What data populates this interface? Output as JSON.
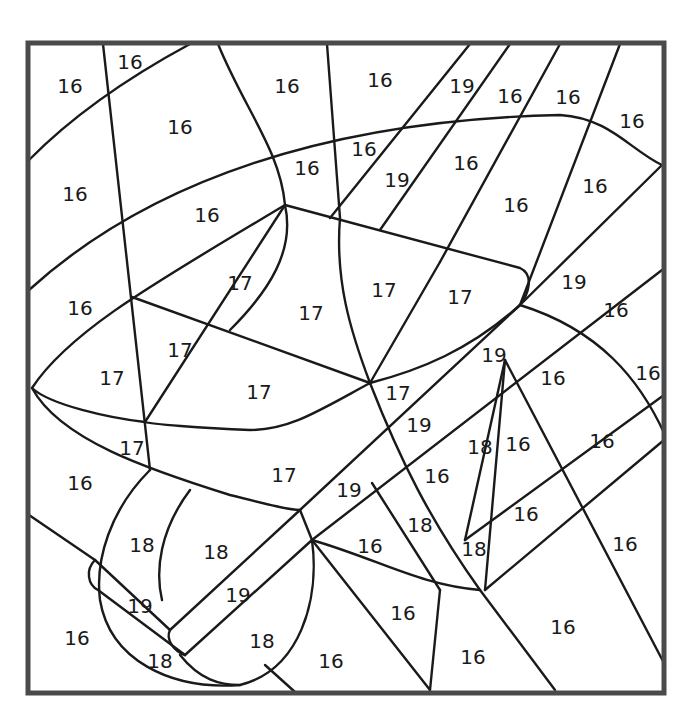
{
  "puzzle": {
    "type": "color-by-number",
    "subject": "wheelbarrow",
    "colors": {
      "line": "#1a1a1a",
      "frame": "#4a4a4a",
      "background": "#ffffff"
    },
    "frame": {
      "x": 28,
      "y": 43,
      "width": 636,
      "height": 650
    },
    "regions": [
      {
        "n": "16",
        "x": 70,
        "y": 86
      },
      {
        "n": "16",
        "x": 130,
        "y": 62
      },
      {
        "n": "16",
        "x": 180,
        "y": 127
      },
      {
        "n": "16",
        "x": 287,
        "y": 86
      },
      {
        "n": "16",
        "x": 380,
        "y": 80
      },
      {
        "n": "19",
        "x": 462,
        "y": 86
      },
      {
        "n": "16",
        "x": 510,
        "y": 96
      },
      {
        "n": "16",
        "x": 568,
        "y": 97
      },
      {
        "n": "16",
        "x": 632,
        "y": 121
      },
      {
        "n": "16",
        "x": 75,
        "y": 194
      },
      {
        "n": "16",
        "x": 207,
        "y": 215
      },
      {
        "n": "16",
        "x": 307,
        "y": 168
      },
      {
        "n": "16",
        "x": 364,
        "y": 149
      },
      {
        "n": "19",
        "x": 397,
        "y": 180
      },
      {
        "n": "16",
        "x": 466,
        "y": 163
      },
      {
        "n": "16",
        "x": 516,
        "y": 205
      },
      {
        "n": "16",
        "x": 595,
        "y": 186
      },
      {
        "n": "16",
        "x": 80,
        "y": 308
      },
      {
        "n": "17",
        "x": 240,
        "y": 283
      },
      {
        "n": "17",
        "x": 311,
        "y": 313
      },
      {
        "n": "17",
        "x": 384,
        "y": 290
      },
      {
        "n": "17",
        "x": 460,
        "y": 297
      },
      {
        "n": "19",
        "x": 574,
        "y": 282
      },
      {
        "n": "16",
        "x": 616,
        "y": 310
      },
      {
        "n": "17",
        "x": 180,
        "y": 350
      },
      {
        "n": "17",
        "x": 112,
        "y": 378
      },
      {
        "n": "17",
        "x": 259,
        "y": 392
      },
      {
        "n": "17",
        "x": 398,
        "y": 393
      },
      {
        "n": "19",
        "x": 494,
        "y": 355
      },
      {
        "n": "16",
        "x": 553,
        "y": 378
      },
      {
        "n": "16",
        "x": 648,
        "y": 373
      },
      {
        "n": "17",
        "x": 132,
        "y": 448
      },
      {
        "n": "19",
        "x": 419,
        "y": 425
      },
      {
        "n": "18",
        "x": 480,
        "y": 447
      },
      {
        "n": "16",
        "x": 518,
        "y": 444
      },
      {
        "n": "16",
        "x": 602,
        "y": 441
      },
      {
        "n": "16",
        "x": 80,
        "y": 483
      },
      {
        "n": "17",
        "x": 284,
        "y": 475
      },
      {
        "n": "16",
        "x": 437,
        "y": 476
      },
      {
        "n": "19",
        "x": 349,
        "y": 490
      },
      {
        "n": "18",
        "x": 420,
        "y": 525
      },
      {
        "n": "16",
        "x": 526,
        "y": 514
      },
      {
        "n": "18",
        "x": 142,
        "y": 545
      },
      {
        "n": "18",
        "x": 216,
        "y": 552
      },
      {
        "n": "16",
        "x": 370,
        "y": 546
      },
      {
        "n": "18",
        "x": 474,
        "y": 549
      },
      {
        "n": "16",
        "x": 625,
        "y": 544
      },
      {
        "n": "19",
        "x": 238,
        "y": 595
      },
      {
        "n": "19",
        "x": 140,
        "y": 606
      },
      {
        "n": "16",
        "x": 403,
        "y": 613
      },
      {
        "n": "16",
        "x": 563,
        "y": 627
      },
      {
        "n": "16",
        "x": 77,
        "y": 638
      },
      {
        "n": "18",
        "x": 262,
        "y": 641
      },
      {
        "n": "18",
        "x": 160,
        "y": 661
      },
      {
        "n": "16",
        "x": 331,
        "y": 661
      },
      {
        "n": "16",
        "x": 473,
        "y": 657
      }
    ]
  }
}
